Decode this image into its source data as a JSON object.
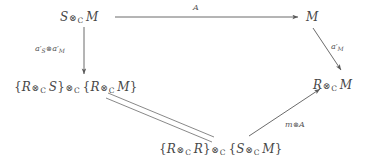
{
  "diagram": {
    "type": "commutative-diagram",
    "background_color": "#ffffff",
    "ink_color": "#474747",
    "nodes": [
      {
        "id": "top-left",
        "latex": "S \\otimes_{\\mathrm{C}} M",
        "plain": "S ⊗_C M",
        "parts": {
          "a": "S",
          "op": "⊗",
          "sub": "C",
          "b": "M"
        }
      },
      {
        "id": "top-right",
        "latex": "M",
        "plain": "M"
      },
      {
        "id": "bottom-left",
        "latex": "\\{R \\otimes_{\\mathrm{C}} S\\} \\otimes_{\\mathrm{C}} \\{R \\otimes_{\\mathrm{C}} M\\}",
        "plain": "{R ⊗_C S} ⊗_C {R ⊗_C M}"
      },
      {
        "id": "right-middle",
        "latex": "R \\otimes_{\\mathrm{C}} M",
        "plain": "R ⊗_C M"
      },
      {
        "id": "bottom-center",
        "latex": "\\{R \\otimes_{\\mathrm{C}} R\\} \\otimes_{\\mathrm{C}} \\{S \\otimes_{\\mathrm{C}} M\\}",
        "plain": "{R ⊗_C R} ⊗_C {S ⊗_C M}"
      }
    ],
    "edges": [
      {
        "id": "top-edge",
        "from": "top-left",
        "to": "top-right",
        "style": "solid-arrow",
        "direction": "right",
        "label": "A"
      },
      {
        "id": "left-edge",
        "from": "top-left",
        "to": "bottom-left",
        "style": "solid-arrow",
        "direction": "down",
        "label": "a'_S ⊗ a'_M"
      },
      {
        "id": "right-edge",
        "from": "top-right",
        "to": "right-middle",
        "style": "solid-arrow",
        "direction": "down-right",
        "label": "a'_M"
      },
      {
        "id": "equality-edge",
        "from": "bottom-left",
        "to": "bottom-center",
        "style": "double-line",
        "direction": "none",
        "label": ""
      },
      {
        "id": "bottom-right-edge",
        "from": "bottom-center",
        "to": "right-middle",
        "style": "solid-arrow",
        "direction": "up-right",
        "label": "m ⊗ A"
      }
    ],
    "labels": {
      "top_arrow": "A",
      "left_arrow_alpha": "a",
      "left_arrow_sub_s": "S",
      "left_arrow_tensor": "⊗",
      "left_arrow_sub_m": "M",
      "right_arrow_alpha": "a",
      "right_arrow_sub_m": "M",
      "bottom_arrow_m": "m",
      "bottom_arrow_tensor": "⊗",
      "bottom_arrow_A": "A",
      "prime": "′",
      "tensor": "⊗",
      "tensor_sub": "C",
      "brace_open": "{",
      "brace_close": "}",
      "letter_S": "S",
      "letter_M": "M",
      "letter_R": "R"
    }
  }
}
